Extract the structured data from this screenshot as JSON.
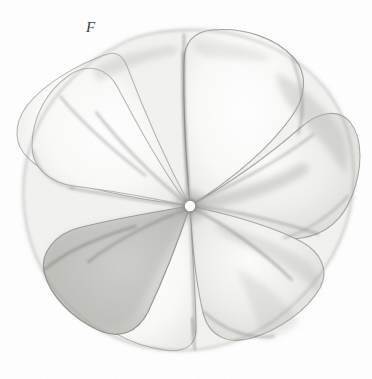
{
  "plate": {
    "background_color": "#ffffff",
    "width": 372,
    "height": 379,
    "medium": "watercolour and graphite botanical illustration",
    "caption": ""
  },
  "figure": {
    "label": "F",
    "label_style": "italic-serif",
    "label_color": "#3a3a3a",
    "label_x": 95,
    "label_y": 32
  },
  "specimen": {
    "name": "flower-corolla-face-view",
    "description": "Flower corolla seen from above, petals arranged as a counter-clockwise pinwheel around a small pale centre",
    "petal_count": 7,
    "centre": {
      "x": 190,
      "y": 206
    },
    "bounds": {
      "left": 18,
      "top": 28,
      "right": 356,
      "bottom": 351
    },
    "palette": {
      "outline": "#8c8c8c",
      "outline_dark": "#5e5e5e",
      "petal_light": "#fbfbfa",
      "petal_mid": "#e2e2e0",
      "petal_shadow": "#c9c9c6",
      "petal_deep_shadow": "#a9a9a6",
      "centre_dot": "#ffffff",
      "centre_ring": "#6e6e6e"
    },
    "petals": [
      {
        "id": "petal-n",
        "name": "upper-centre-petal",
        "tone": "light",
        "angle_deg": 92
      },
      {
        "id": "petal-ne",
        "name": "upper-right-petal",
        "tone": "light",
        "angle_deg": 38
      },
      {
        "id": "petal-e",
        "name": "right-petal",
        "tone": "mid",
        "angle_deg": 350
      },
      {
        "id": "petal-se",
        "name": "lower-right-petal",
        "tone": "mid",
        "angle_deg": 300
      },
      {
        "id": "petal-s",
        "name": "lower-centre-petal",
        "tone": "light",
        "angle_deg": 255
      },
      {
        "id": "petal-sw",
        "name": "lower-left-petal",
        "tone": "shadow",
        "angle_deg": 195
      },
      {
        "id": "petal-nw",
        "name": "upper-left-petal",
        "tone": "light",
        "angle_deg": 140
      }
    ]
  }
}
